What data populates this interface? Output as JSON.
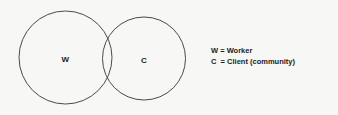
{
  "figure": {
    "type": "venn-diagram",
    "background_color": "#f7f7f5",
    "stroke_color": "#4a4a4a",
    "text_color": "#1c1c1c"
  },
  "sets": [
    {
      "id": "w",
      "label": "W",
      "name": "Worker",
      "cx": 65.5,
      "cy": 57.5,
      "r": 46.5
    },
    {
      "id": "c",
      "label": "C",
      "name": "Client (community)",
      "cx": 144,
      "cy": 58.5,
      "r": 41.5
    }
  ],
  "legend": {
    "lines": [
      "W = Worker",
      "C  = Client (community)"
    ]
  }
}
